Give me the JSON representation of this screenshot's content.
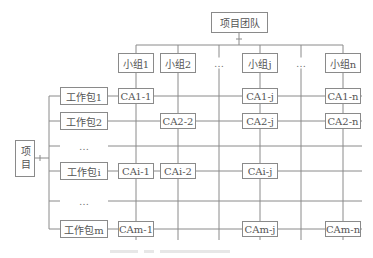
{
  "diagram": {
    "type": "matrix-organization",
    "root": {
      "label": "项目团队"
    },
    "project": {
      "label": "项目"
    },
    "groups": [
      {
        "label": "小组1",
        "x": 136
      },
      {
        "label": "小组2",
        "x": 178
      },
      {
        "label": "…",
        "x": 219,
        "ellipsis": true
      },
      {
        "label": "小组j",
        "x": 260
      },
      {
        "label": "…",
        "x": 301,
        "ellipsis": true
      },
      {
        "label": "小组n",
        "x": 343
      }
    ],
    "work_packages": [
      {
        "label": "工作包1",
        "y": 96
      },
      {
        "label": "工作包2",
        "y": 121
      },
      {
        "label": "…",
        "y": 146,
        "ellipsis": true
      },
      {
        "label": "工作包i",
        "y": 171
      },
      {
        "label": "…",
        "y": 201,
        "ellipsis": true
      },
      {
        "label": "工作包m",
        "y": 229
      }
    ],
    "control_accounts": [
      {
        "label": "CA1-1",
        "row": 0,
        "col": 0
      },
      {
        "label": "CA1-j",
        "row": 0,
        "col": 3
      },
      {
        "label": "CA1-n",
        "row": 0,
        "col": 5
      },
      {
        "label": "CA2-2",
        "row": 1,
        "col": 1
      },
      {
        "label": "CA2-j",
        "row": 1,
        "col": 3
      },
      {
        "label": "CA2-n",
        "row": 1,
        "col": 5
      },
      {
        "label": "CAi-1",
        "row": 3,
        "col": 0
      },
      {
        "label": "CAi-2",
        "row": 3,
        "col": 1
      },
      {
        "label": "CAi-j",
        "row": 3,
        "col": 3
      },
      {
        "label": "CAm-1",
        "row": 5,
        "col": 0
      },
      {
        "label": "CAm-j",
        "row": 5,
        "col": 3
      },
      {
        "label": "CAm-n",
        "row": 5,
        "col": 5
      }
    ],
    "caption": {
      "legible": false
    }
  },
  "colors": {
    "line": "#8a8a8a",
    "text": "#555555",
    "background": "#ffffff"
  }
}
